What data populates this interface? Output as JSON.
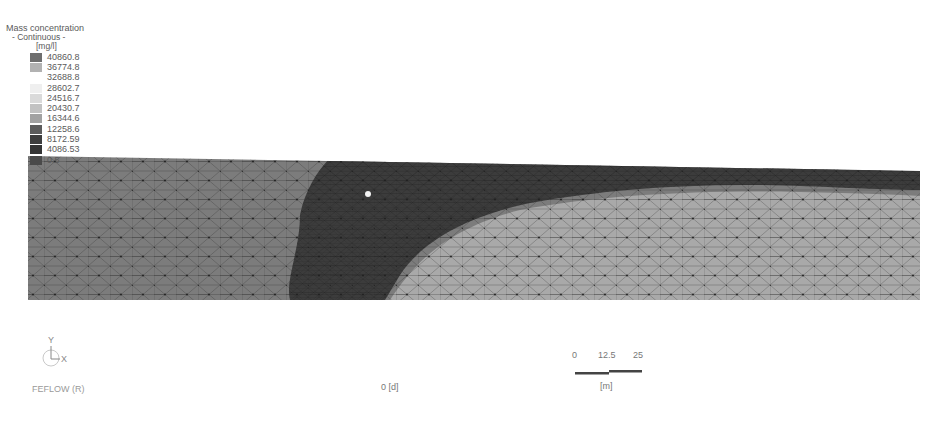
{
  "legend": {
    "title": "Mass concentration",
    "subtitle": "- Continuous -",
    "unit": "[mg/l]",
    "entries": [
      {
        "value": "40860.8",
        "color": "#6e6e6e"
      },
      {
        "value": "36774.8",
        "color": "#b2b2b2"
      },
      {
        "value": "32688.8",
        "color": "#ffffff"
      },
      {
        "value": "28602.7",
        "color": "#efefef"
      },
      {
        "value": "24516.7",
        "color": "#dadada"
      },
      {
        "value": "20430.7",
        "color": "#c2c2c2"
      },
      {
        "value": "16344.6",
        "color": "#a2a2a2"
      },
      {
        "value": "12258.6",
        "color": "#5c5c5c"
      },
      {
        "value": "8172.59",
        "color": "#3e3e3e"
      },
      {
        "value": "4086.53",
        "color": "#353535"
      },
      {
        "value": "0.5",
        "color": "#4a4a4a"
      }
    ]
  },
  "plot": {
    "mesh_colors": {
      "background_region": "#7c7c7c",
      "plume_dark": "#3c3c3c",
      "light_region": "#a9a9a9",
      "mesh_lines": "#2a2a2a"
    },
    "source_marker": "white-dot"
  },
  "axis": {
    "y_label": "Y",
    "x_label": "X"
  },
  "footer": {
    "software": "FEFLOW (R)",
    "time": "0 [d]"
  },
  "scale_bar": {
    "ticks": [
      "0",
      "12.5",
      "25"
    ],
    "unit": "[m]"
  }
}
